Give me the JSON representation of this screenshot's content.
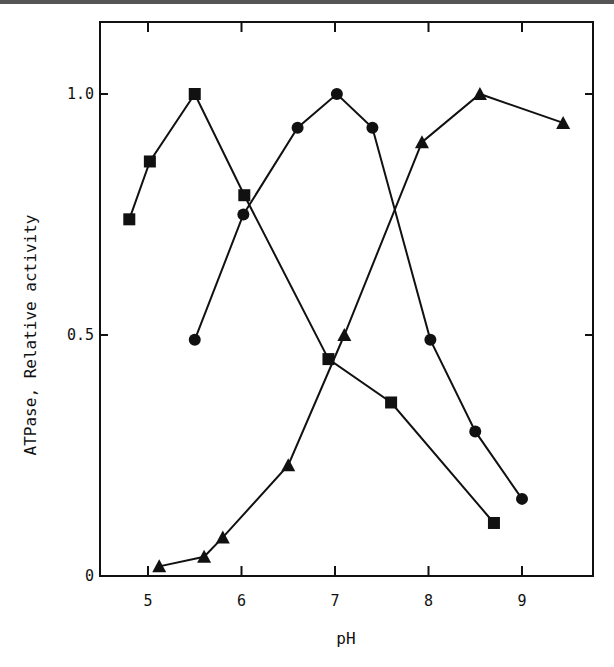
{
  "chart_data": {
    "type": "line",
    "title": "",
    "xlabel": "pH",
    "ylabel": "ATPase, Relative activity",
    "xlim": [
      4.55,
      9.85
    ],
    "ylim": [
      0,
      1.15
    ],
    "xticks": [
      5,
      6,
      7,
      8,
      9
    ],
    "xtick_labels": [
      "5",
      "6",
      "7",
      "8",
      "9"
    ],
    "yticks": [
      0,
      0.5,
      1.0
    ],
    "ytick_labels": [
      "0",
      "0.5",
      "1.0"
    ],
    "grid": false,
    "legend": null,
    "series": [
      {
        "name": "squares",
        "marker": "square",
        "x": [
          4.8,
          5.02,
          5.5,
          6.03,
          6.93,
          7.6,
          8.7
        ],
        "y": [
          0.74,
          0.86,
          1.0,
          0.79,
          0.45,
          0.36,
          0.11
        ]
      },
      {
        "name": "circles",
        "marker": "circle",
        "x": [
          5.5,
          6.02,
          6.6,
          7.02,
          7.4,
          8.02,
          8.5,
          9.0
        ],
        "y": [
          0.49,
          0.75,
          0.93,
          1.0,
          0.93,
          0.49,
          0.3,
          0.16
        ]
      },
      {
        "name": "triangles",
        "marker": "triangle",
        "x": [
          5.12,
          5.6,
          5.8,
          6.5,
          7.1,
          7.93,
          8.55,
          9.44
        ],
        "y": [
          0.02,
          0.04,
          0.08,
          0.23,
          0.5,
          0.9,
          1.0,
          0.94
        ]
      }
    ]
  }
}
